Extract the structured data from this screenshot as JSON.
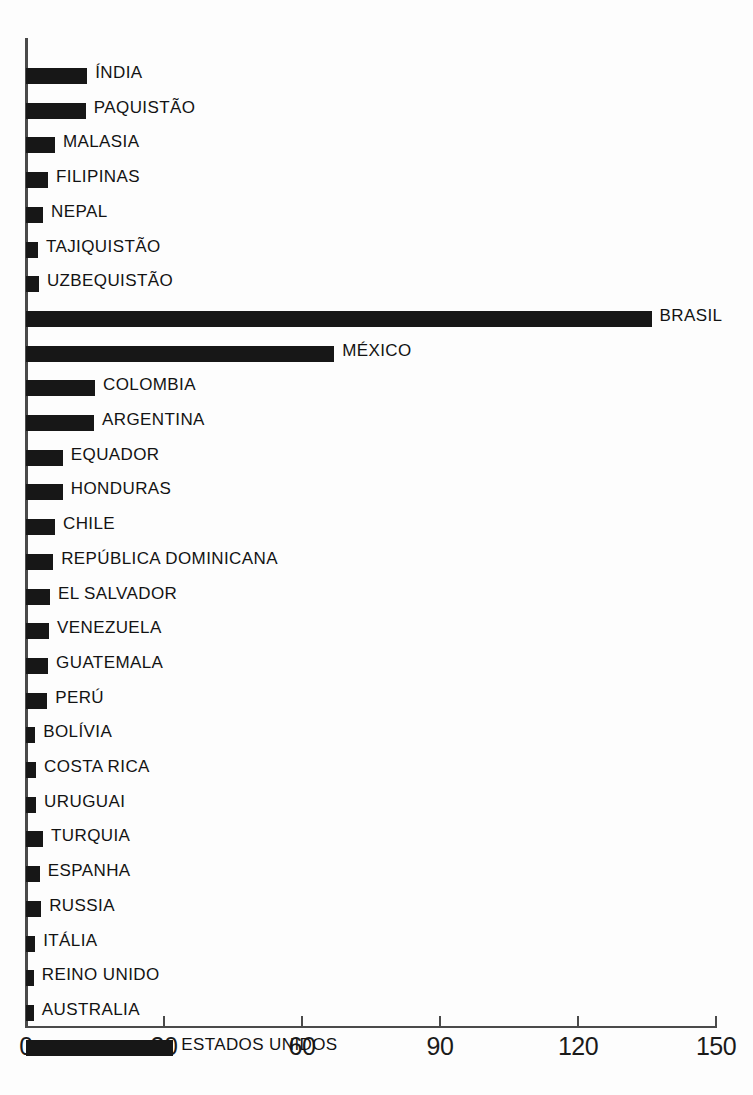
{
  "chart_data": {
    "type": "bar",
    "orientation": "horizontal",
    "title": "",
    "subtitle": "",
    "xlabel": "",
    "ylabel": "",
    "xlim": [
      0,
      150
    ],
    "ylim": null,
    "grid": false,
    "legend": null,
    "xticks": [
      0,
      30,
      60,
      90,
      120,
      150
    ],
    "xtick_labels": [
      "0",
      "30",
      "60",
      "90",
      "120",
      "150"
    ],
    "bar_color": "#171717",
    "axis_color": "#4a4a4a",
    "categories": [
      "ÍNDIA",
      "PAQUISTÃO",
      "MALASIA",
      "FILIPINAS",
      "NEPAL",
      "TAJIQUISTÃO",
      "UZBEQUISTÃO",
      "BRASIL",
      "MÉXICO",
      "COLOMBIA",
      "ARGENTINA",
      "EQUADOR",
      "HONDURAS",
      "CHILE",
      "REPÚBLICA  DOMINICANA",
      "EL  SALVADOR",
      "VENEZUELA",
      "GUATEMALA",
      "PERÚ",
      "BOLÍVIA",
      "COSTA  RICA",
      "URUGUAI",
      "TURQUIA",
      "ESPANHA",
      "RUSSIA",
      "ITÁLIA",
      "REINO  UNIDO",
      "AUSTRALIA",
      "ESTADOS  UNIDOS"
    ],
    "values": [
      13.3,
      13.0,
      6.3,
      4.8,
      3.7,
      2.6,
      2.8,
      136.0,
      67.0,
      15.0,
      14.8,
      8.0,
      8.0,
      6.3,
      5.9,
      5.2,
      5.0,
      4.8,
      4.6,
      2.0,
      2.2,
      2.2,
      3.7,
      3.0,
      3.3,
      2.0,
      1.7,
      1.7,
      32.0
    ]
  }
}
